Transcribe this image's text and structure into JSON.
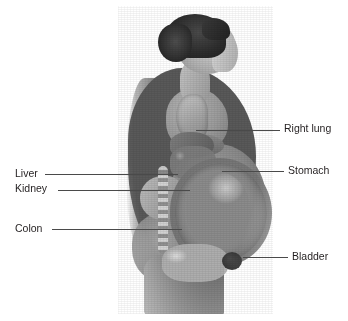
{
  "figure": {
    "kind": "anatomical-illustration",
    "background_color": "#ffffff",
    "rendering": "grayscale photograph with organ overlay"
  },
  "labels": [
    {
      "id": "right-lung",
      "text": "Right lung",
      "side": "right",
      "text_x": 284,
      "text_y": 122,
      "leader_x1": 196,
      "leader_x2": 280,
      "leader_y": 130
    },
    {
      "id": "stomach",
      "text": "Stomach",
      "side": "right",
      "text_x": 288,
      "text_y": 164,
      "leader_x1": 222,
      "leader_x2": 284,
      "leader_y": 171
    },
    {
      "id": "liver",
      "text": "Liver",
      "side": "left",
      "text_x": 15,
      "text_y": 167,
      "leader_x1": 45,
      "leader_x2": 178,
      "leader_y": 174
    },
    {
      "id": "kidney",
      "text": "Kidney",
      "side": "left",
      "text_x": 15,
      "text_y": 182,
      "leader_x1": 58,
      "leader_x2": 190,
      "leader_y": 190
    },
    {
      "id": "colon",
      "text": "Colon",
      "side": "left",
      "text_x": 15,
      "text_y": 222,
      "leader_x1": 52,
      "leader_x2": 182,
      "leader_y": 229
    },
    {
      "id": "bladder",
      "text": "Bladder",
      "side": "right",
      "text_x": 292,
      "text_y": 250,
      "leader_x1": 243,
      "leader_x2": 288,
      "leader_y": 257
    }
  ],
  "colors": {
    "label_text": "#231f20",
    "leader_line": "#4a4a4a",
    "hair_dark": "#1d1d1d",
    "skin_mid": "#9a9a9a",
    "organ_mid": "#8b8b8b"
  }
}
